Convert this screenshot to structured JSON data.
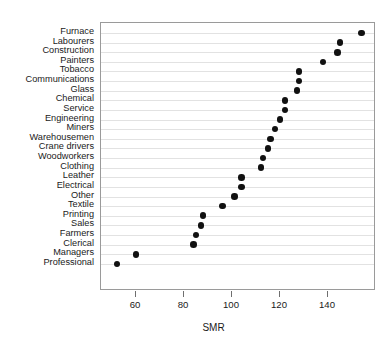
{
  "chart_data": {
    "type": "scatter",
    "subtype": "cleveland-dot-plot",
    "title": "",
    "xlabel": "SMR",
    "ylabel": "",
    "xlim": [
      48,
      160
    ],
    "xticks": [
      60,
      80,
      100,
      120,
      140
    ],
    "xticklabels": [
      "60",
      "80",
      "100",
      "120",
      "140"
    ],
    "grid": "horizontal",
    "legend": "none",
    "orientation": "horizontal",
    "marker": "filled-circle",
    "marker_color": "#111111",
    "categories": [
      "Furnace",
      "Labourers",
      "Construction",
      "Painters",
      "Tobacco",
      "Communications",
      "Glass",
      "Chemical",
      "Service",
      "Engineering",
      "Miners",
      "Warehousemen",
      "Crane drivers",
      "Woodworkers",
      "Clothing",
      "Leather",
      "Electrical",
      "Other",
      "Textile",
      "Printing",
      "Sales",
      "Farmers",
      "Clerical",
      "Managers",
      "Professional"
    ],
    "values": [
      154,
      145,
      144,
      138,
      128,
      128,
      127,
      122,
      122,
      120,
      118,
      116,
      115,
      113,
      112,
      104,
      104,
      101,
      96,
      88,
      87,
      85,
      84,
      60,
      52
    ]
  },
  "panel": {
    "border_color": "#9a9a9a",
    "grid_color": "#e2e2e2",
    "background": "#ffffff"
  }
}
